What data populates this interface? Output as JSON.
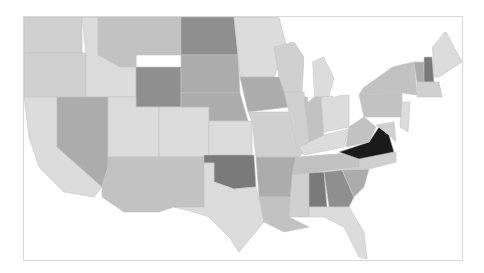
{
  "map": {
    "type": "choropleth",
    "region": "United States (contiguous)",
    "colors": {
      "very_light": "#dcdcdc",
      "light": "#d0d0d0",
      "medium_light": "#c2c2c2",
      "medium": "#acacac",
      "medium_dark": "#8f8f8f",
      "dark": "#7a7a7a",
      "darkest": "#1a1a1a",
      "water": "#ffffff",
      "border": "#d8d8d8"
    },
    "states": [
      {
        "id": "WA",
        "shade": "light"
      },
      {
        "id": "OR",
        "shade": "light"
      },
      {
        "id": "CA",
        "shade": "very_light"
      },
      {
        "id": "ID",
        "shade": "very_light"
      },
      {
        "id": "NV",
        "shade": "medium"
      },
      {
        "id": "MT",
        "shade": "medium_light"
      },
      {
        "id": "WY",
        "shade": "medium_dark"
      },
      {
        "id": "UT",
        "shade": "very_light"
      },
      {
        "id": "AZ",
        "shade": "medium_light"
      },
      {
        "id": "CO",
        "shade": "very_light"
      },
      {
        "id": "NM",
        "shade": "medium_light"
      },
      {
        "id": "ND",
        "shade": "medium_dark"
      },
      {
        "id": "SD",
        "shade": "medium"
      },
      {
        "id": "NE",
        "shade": "medium"
      },
      {
        "id": "KS",
        "shade": "very_light"
      },
      {
        "id": "OK",
        "shade": "dark"
      },
      {
        "id": "TX",
        "shade": "very_light"
      },
      {
        "id": "MN",
        "shade": "very_light"
      },
      {
        "id": "IA",
        "shade": "medium"
      },
      {
        "id": "MO",
        "shade": "light"
      },
      {
        "id": "AR",
        "shade": "medium"
      },
      {
        "id": "LA",
        "shade": "medium_light"
      },
      {
        "id": "WI",
        "shade": "light"
      },
      {
        "id": "IL",
        "shade": "light"
      },
      {
        "id": "MI",
        "shade": "very_light"
      },
      {
        "id": "IN",
        "shade": "medium_light"
      },
      {
        "id": "OH",
        "shade": "very_light"
      },
      {
        "id": "KY",
        "shade": "very_light"
      },
      {
        "id": "TN",
        "shade": "medium_light"
      },
      {
        "id": "MS",
        "shade": "light"
      },
      {
        "id": "AL",
        "shade": "dark"
      },
      {
        "id": "GA",
        "shade": "medium_dark"
      },
      {
        "id": "FL",
        "shade": "very_light"
      },
      {
        "id": "SC",
        "shade": "medium"
      },
      {
        "id": "NC",
        "shade": "light"
      },
      {
        "id": "VA",
        "shade": "darkest"
      },
      {
        "id": "WV",
        "shade": "medium_light"
      },
      {
        "id": "MD",
        "shade": "light"
      },
      {
        "id": "PA",
        "shade": "medium_light"
      },
      {
        "id": "NY",
        "shade": "medium_light"
      },
      {
        "id": "VT",
        "shade": "medium"
      },
      {
        "id": "NH",
        "shade": "dark"
      },
      {
        "id": "ME",
        "shade": "very_light"
      },
      {
        "id": "MA",
        "shade": "light"
      },
      {
        "id": "NJ",
        "shade": "very_light"
      }
    ]
  }
}
